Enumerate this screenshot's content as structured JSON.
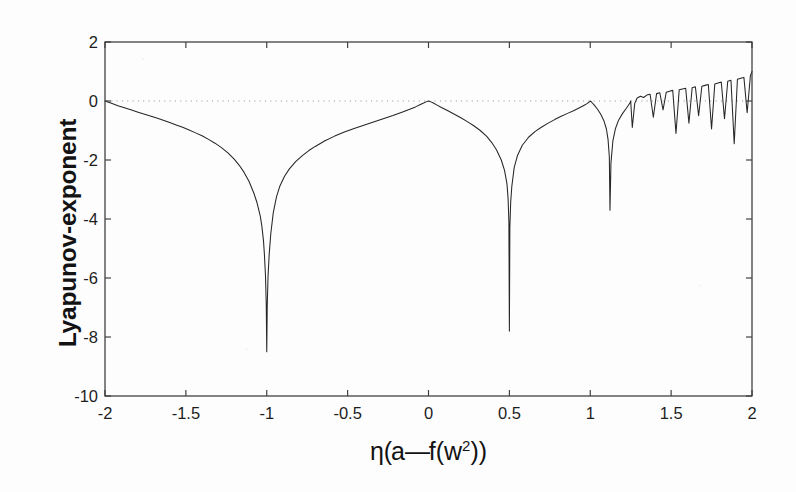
{
  "figure": {
    "background_color": "#fdfdfd",
    "axis_color": "#3b3b3b",
    "curve_color": "#262626",
    "zero_line_color": "#9a9a9a"
  },
  "axes": {
    "ylabel": "Lyapunov-exponent",
    "xlabel_parts": {
      "eta": "η",
      "open_paren": "(",
      "a": "a",
      "minus": "—",
      "f": "f",
      "open_paren2": "(",
      "w": "w",
      "exponent": "2",
      "close_parens": "))"
    },
    "xlabel_plain": "η(a—f(w2))",
    "xtick_labels": [
      "-2",
      "-1.5",
      "-1",
      "-0.5",
      "0",
      "0.5",
      "1",
      "1.5",
      "2"
    ],
    "ytick_labels": [
      "2",
      "0",
      "-2",
      "-4",
      "-6",
      "-8",
      "-10"
    ]
  },
  "chart_data": {
    "type": "line",
    "title": "",
    "xlabel": "η(a—f(w2))",
    "ylabel": "Lyapunov-exponent",
    "xlim": [
      -2,
      2
    ],
    "ylim": [
      -10,
      2
    ],
    "xticks": [
      -2,
      -1.5,
      -1,
      -0.5,
      0,
      0.5,
      1,
      1.5,
      2
    ],
    "yticks": [
      2,
      0,
      -2,
      -4,
      -6,
      -8,
      -10
    ],
    "grid": false,
    "legend": "none",
    "reference_lines": [
      {
        "orientation": "horizontal",
        "value": 0,
        "style": "dotted",
        "color": "#9a9a9a"
      }
    ],
    "annotations": [
      {
        "x": -1.0,
        "y": -8.5,
        "text": "superstable dip"
      },
      {
        "x": 0.0,
        "y": 0.0,
        "text": "tangent to zero"
      },
      {
        "x": 0.5,
        "y": -7.8,
        "text": "superstable dip"
      },
      {
        "x": 1.0,
        "y": 0.0,
        "text": "tangent to zero"
      },
      {
        "x": 1.12,
        "y": -3.7,
        "text": "superstable dip"
      },
      {
        "x": 1.25,
        "y": 0.0,
        "text": "onset of chaos"
      },
      {
        "x": 2.0,
        "y": 1.0,
        "text": "maximum exponent"
      }
    ],
    "series": [
      {
        "name": "Lyapunov exponent",
        "x": [
          -2.0,
          -1.96,
          -1.92,
          -1.88,
          -1.84,
          -1.8,
          -1.76,
          -1.72,
          -1.68,
          -1.64,
          -1.6,
          -1.56,
          -1.52,
          -1.48,
          -1.44,
          -1.4,
          -1.36,
          -1.32,
          -1.28,
          -1.24,
          -1.2,
          -1.17,
          -1.14,
          -1.11,
          -1.08,
          -1.06,
          -1.04,
          -1.03,
          -1.02,
          -1.015,
          -1.008,
          -1.003,
          -1.0,
          -0.997,
          -0.992,
          -0.985,
          -0.975,
          -0.96,
          -0.94,
          -0.92,
          -0.89,
          -0.86,
          -0.82,
          -0.78,
          -0.74,
          -0.7,
          -0.64,
          -0.58,
          -0.52,
          -0.46,
          -0.4,
          -0.34,
          -0.28,
          -0.22,
          -0.16,
          -0.12,
          -0.08,
          -0.05,
          -0.03,
          -0.015,
          0.0,
          0.015,
          0.03,
          0.05,
          0.08,
          0.12,
          0.16,
          0.2,
          0.24,
          0.28,
          0.32,
          0.36,
          0.39,
          0.42,
          0.45,
          0.47,
          0.485,
          0.492,
          0.497,
          0.5,
          0.503,
          0.508,
          0.515,
          0.53,
          0.55,
          0.58,
          0.62,
          0.66,
          0.7,
          0.74,
          0.78,
          0.82,
          0.86,
          0.9,
          0.93,
          0.96,
          0.98,
          0.995,
          1.0,
          1.01,
          1.025,
          1.045,
          1.065,
          1.085,
          1.1,
          1.11,
          1.118,
          1.122,
          1.128,
          1.14,
          1.155,
          1.175,
          1.2,
          1.22,
          1.235,
          1.245,
          1.25,
          1.26,
          1.275,
          1.29,
          1.31,
          1.33,
          1.35,
          1.37,
          1.39,
          1.41,
          1.43,
          1.45,
          1.47,
          1.49,
          1.51,
          1.53,
          1.55,
          1.57,
          1.59,
          1.61,
          1.63,
          1.65,
          1.67,
          1.69,
          1.71,
          1.73,
          1.75,
          1.77,
          1.79,
          1.81,
          1.83,
          1.85,
          1.87,
          1.89,
          1.91,
          1.93,
          1.95,
          1.97,
          1.99,
          2.0
        ],
        "y": [
          0.0,
          -0.08,
          -0.16,
          -0.23,
          -0.3,
          -0.37,
          -0.44,
          -0.51,
          -0.58,
          -0.65,
          -0.73,
          -0.81,
          -0.89,
          -0.98,
          -1.08,
          -1.18,
          -1.3,
          -1.43,
          -1.58,
          -1.76,
          -1.98,
          -2.18,
          -2.42,
          -2.72,
          -3.12,
          -3.45,
          -3.9,
          -4.25,
          -4.75,
          -5.15,
          -5.9,
          -6.9,
          -8.5,
          -6.95,
          -5.95,
          -5.2,
          -4.5,
          -3.8,
          -3.25,
          -2.9,
          -2.55,
          -2.3,
          -2.05,
          -1.85,
          -1.68,
          -1.54,
          -1.35,
          -1.19,
          -1.05,
          -0.93,
          -0.82,
          -0.71,
          -0.6,
          -0.49,
          -0.37,
          -0.29,
          -0.2,
          -0.12,
          -0.07,
          -0.03,
          0.0,
          -0.03,
          -0.07,
          -0.13,
          -0.22,
          -0.33,
          -0.45,
          -0.57,
          -0.7,
          -0.84,
          -1.0,
          -1.2,
          -1.4,
          -1.65,
          -2.0,
          -2.35,
          -2.8,
          -3.3,
          -4.1,
          -7.8,
          -4.3,
          -3.45,
          -2.9,
          -2.25,
          -1.85,
          -1.5,
          -1.22,
          -1.03,
          -0.88,
          -0.75,
          -0.63,
          -0.52,
          -0.42,
          -0.32,
          -0.24,
          -0.15,
          -0.09,
          -0.03,
          0.0,
          -0.05,
          -0.14,
          -0.28,
          -0.45,
          -0.68,
          -0.95,
          -1.3,
          -1.9,
          -3.7,
          -2.1,
          -1.35,
          -0.95,
          -0.65,
          -0.42,
          -0.27,
          -0.15,
          -0.07,
          0.0,
          -0.9,
          -0.08,
          0.1,
          0.16,
          0.12,
          0.2,
          0.23,
          -0.55,
          0.25,
          0.28,
          -0.3,
          0.3,
          0.33,
          0.36,
          -1.1,
          0.38,
          0.41,
          0.43,
          -0.75,
          0.45,
          0.48,
          -0.5,
          0.5,
          0.53,
          0.56,
          -0.95,
          0.58,
          0.61,
          0.64,
          -0.6,
          0.67,
          0.7,
          -1.45,
          0.74,
          0.77,
          0.8,
          -0.4,
          0.85,
          1.0
        ]
      }
    ]
  },
  "render": {
    "plot_left": 105,
    "plot_right": 752,
    "plot_top": 42,
    "plot_bottom": 396
  }
}
